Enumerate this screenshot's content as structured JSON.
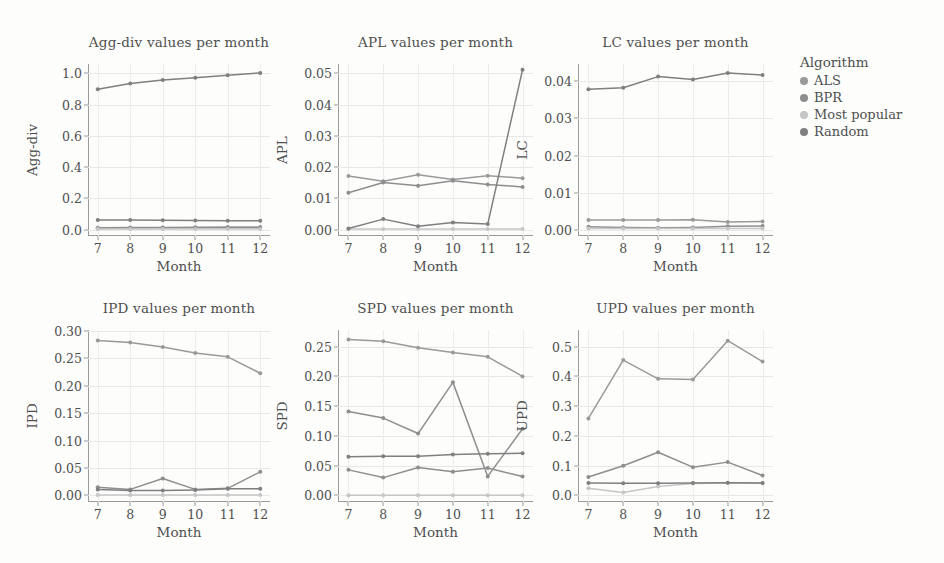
{
  "figure": {
    "xlabel": "Month",
    "months": [
      7,
      8,
      9,
      10,
      11,
      12
    ]
  },
  "legend": {
    "title": "Algorithm",
    "entries": [
      {
        "label": "ALS",
        "color": "#9a9a9a"
      },
      {
        "label": "BPR",
        "color": "#8e8e8e"
      },
      {
        "label": "Most popular",
        "color": "#c6c6c6"
      },
      {
        "label": "Random",
        "color": "#7f7f7f"
      }
    ]
  },
  "chart_data": [
    {
      "type": "line",
      "title": "Agg-div values per month",
      "xlabel": "Month",
      "ylabel": "Agg-div",
      "x": [
        7,
        8,
        9,
        10,
        11,
        12
      ],
      "xlim": [
        6.7,
        12.3
      ],
      "ylim": [
        -0.04,
        1.06
      ],
      "yticks": [
        0.0,
        0.2,
        0.4,
        0.6,
        0.8,
        1.0
      ],
      "ytick_labels": [
        "0.0",
        "0.2",
        "0.4",
        "0.6",
        "0.8",
        "1.0"
      ],
      "grid": true,
      "series": [
        {
          "name": "ALS",
          "color": "#9a9a9a",
          "values": [
            0.012,
            0.014,
            0.015,
            0.016,
            0.017,
            0.018
          ]
        },
        {
          "name": "BPR",
          "color": "#8e8e8e",
          "values": [
            0.01,
            0.011,
            0.012,
            0.012,
            0.013,
            0.013
          ]
        },
        {
          "name": "Most popular",
          "color": "#c6c6c6",
          "values": [
            0.004,
            0.004,
            0.004,
            0.004,
            0.004,
            0.004
          ]
        },
        {
          "name": "Random",
          "color": "#7f7f7f",
          "values": [
            0.063,
            0.062,
            0.06,
            0.059,
            0.058,
            0.057
          ]
        },
        {
          "name": "Random-top",
          "color": "#7f7f7f",
          "values": [
            0.898,
            0.936,
            0.957,
            0.972,
            0.988,
            1.003
          ]
        }
      ]
    },
    {
      "type": "line",
      "title": "APL values per month",
      "xlabel": "Month",
      "ylabel": "APL",
      "x": [
        7,
        8,
        9,
        10,
        11,
        12
      ],
      "xlim": [
        6.7,
        12.3
      ],
      "ylim": [
        -0.002,
        0.053
      ],
      "yticks": [
        0.0,
        0.01,
        0.02,
        0.03,
        0.04,
        0.05
      ],
      "ytick_labels": [
        "0.00",
        "0.01",
        "0.02",
        "0.03",
        "0.04",
        "0.05"
      ],
      "grid": true,
      "series": [
        {
          "name": "ALS",
          "color": "#9a9a9a",
          "values": [
            0.0172,
            0.0155,
            0.0176,
            0.0161,
            0.0173,
            0.0165
          ]
        },
        {
          "name": "BPR",
          "color": "#8e8e8e",
          "values": [
            0.0118,
            0.0151,
            0.0141,
            0.0157,
            0.0145,
            0.0137
          ]
        },
        {
          "name": "Most popular",
          "color": "#c6c6c6",
          "values": [
            0.0002,
            0.0002,
            0.0002,
            0.0002,
            0.0002,
            0.0002
          ]
        },
        {
          "name": "Random",
          "color": "#7f7f7f",
          "values": [
            0.0004,
            0.0034,
            0.0011,
            0.0023,
            0.0018,
            0.0512
          ]
        }
      ]
    },
    {
      "type": "line",
      "title": "LC values per month",
      "xlabel": "Month",
      "ylabel": "LC",
      "x": [
        7,
        8,
        9,
        10,
        11,
        12
      ],
      "xlim": [
        6.7,
        12.3
      ],
      "ylim": [
        -0.0017,
        0.0447
      ],
      "yticks": [
        0.0,
        0.01,
        0.02,
        0.03,
        0.04
      ],
      "ytick_labels": [
        "0.00",
        "0.01",
        "0.02",
        "0.03",
        "0.04"
      ],
      "grid": true,
      "series": [
        {
          "name": "ALS",
          "color": "#9a9a9a",
          "values": [
            0.0026,
            0.0026,
            0.0026,
            0.0027,
            0.0021,
            0.0022
          ]
        },
        {
          "name": "BPR",
          "color": "#8e8e8e",
          "values": [
            0.0008,
            0.0006,
            0.0005,
            0.0006,
            0.0009,
            0.001
          ]
        },
        {
          "name": "Most popular",
          "color": "#c6c6c6",
          "values": [
            0.0003,
            0.0003,
            0.0003,
            0.0003,
            0.0003,
            0.0003
          ]
        },
        {
          "name": "Random",
          "color": "#7f7f7f",
          "values": [
            0.0379,
            0.0383,
            0.0413,
            0.0405,
            0.0423,
            0.0417
          ]
        }
      ]
    },
    {
      "type": "line",
      "title": "IPD values per month",
      "xlabel": "Month",
      "ylabel": "IPD",
      "x": [
        7,
        8,
        9,
        10,
        11,
        12
      ],
      "xlim": [
        6.7,
        12.3
      ],
      "ylim": [
        -0.012,
        0.302
      ],
      "yticks": [
        0.0,
        0.05,
        0.1,
        0.15,
        0.2,
        0.25,
        0.3
      ],
      "ytick_labels": [
        "0.00",
        "0.05",
        "0.10",
        "0.15",
        "0.20",
        "0.25",
        "0.30"
      ],
      "grid": true,
      "series": [
        {
          "name": "ALS",
          "color": "#9a9a9a",
          "values": [
            0.283,
            0.279,
            0.271,
            0.26,
            0.253,
            0.223
          ]
        },
        {
          "name": "BPR",
          "color": "#8e8e8e",
          "values": [
            0.015,
            0.011,
            0.031,
            0.011,
            0.013,
            0.043
          ]
        },
        {
          "name": "Most popular",
          "color": "#c6c6c6",
          "values": [
            0.001,
            0.001,
            0.001,
            0.001,
            0.001,
            0.001
          ]
        },
        {
          "name": "Random",
          "color": "#7f7f7f",
          "values": [
            0.011,
            0.009,
            0.009,
            0.01,
            0.012,
            0.012
          ]
        }
      ]
    },
    {
      "type": "line",
      "title": "SPD values per month",
      "xlabel": "Month",
      "ylabel": "SPD",
      "x": [
        7,
        8,
        9,
        10,
        11,
        12
      ],
      "xlim": [
        6.7,
        12.3
      ],
      "ylim": [
        -0.011,
        0.278
      ],
      "yticks": [
        0.0,
        0.05,
        0.1,
        0.15,
        0.2,
        0.25
      ],
      "ytick_labels": [
        "0.00",
        "0.05",
        "0.10",
        "0.15",
        "0.20",
        "0.25"
      ],
      "grid": true,
      "series": [
        {
          "name": "ALS",
          "color": "#9a9a9a",
          "values": [
            0.262,
            0.259,
            0.248,
            0.24,
            0.233,
            0.2
          ]
        },
        {
          "name": "BPR",
          "color": "#8e8e8e",
          "values": [
            0.141,
            0.13,
            0.104,
            0.19,
            0.032,
            0.112
          ]
        },
        {
          "name": "Most popular",
          "color": "#c6c6c6",
          "values": [
            0.0005,
            0.0005,
            0.0005,
            0.0005,
            0.0005,
            0.0005
          ]
        },
        {
          "name": "Random",
          "color": "#7f7f7f",
          "values": [
            0.065,
            0.066,
            0.066,
            0.069,
            0.07,
            0.071
          ]
        },
        {
          "name": "Random-low",
          "color": "#8e8e8e",
          "values": [
            0.043,
            0.03,
            0.047,
            0.04,
            0.046,
            0.032
          ]
        }
      ]
    },
    {
      "type": "line",
      "title": "UPD values per month",
      "xlabel": "Month",
      "ylabel": "UPD",
      "x": [
        7,
        8,
        9,
        10,
        11,
        12
      ],
      "xlim": [
        6.7,
        12.3
      ],
      "ylim": [
        -0.022,
        0.556
      ],
      "yticks": [
        0.0,
        0.1,
        0.2,
        0.3,
        0.4,
        0.5
      ],
      "ytick_labels": [
        "0.0",
        "0.1",
        "0.2",
        "0.3",
        "0.4",
        "0.5"
      ],
      "grid": true,
      "series": [
        {
          "name": "ALS",
          "color": "#9a9a9a",
          "values": [
            0.259,
            0.455,
            0.392,
            0.39,
            0.52,
            0.45
          ]
        },
        {
          "name": "BPR",
          "color": "#8e8e8e",
          "values": [
            0.062,
            0.1,
            0.145,
            0.095,
            0.112,
            0.067
          ]
        },
        {
          "name": "Most popular",
          "color": "#c6c6c6",
          "values": [
            0.024,
            0.01,
            0.03,
            0.04,
            0.042,
            0.041
          ]
        },
        {
          "name": "Random",
          "color": "#7f7f7f",
          "values": [
            0.042,
            0.041,
            0.041,
            0.042,
            0.043,
            0.042
          ]
        }
      ]
    }
  ]
}
